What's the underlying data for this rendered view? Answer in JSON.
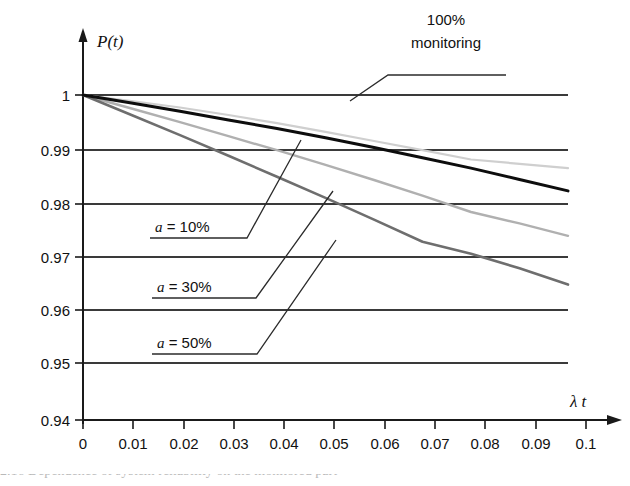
{
  "figure": {
    "caption_fragment": "2.16   Dependence of system reliability on the monitored part"
  },
  "axes": {
    "y_title": "P(t)",
    "x_title": "λ t",
    "y_ticks": [
      "1",
      "0.99",
      "0.98",
      "0.97",
      "0.96",
      "0.95",
      "0.94"
    ],
    "x_ticks": [
      "0",
      "0.01",
      "0.02",
      "0.03",
      "0.04",
      "0.05",
      "0.06",
      "0.07",
      "0.08",
      "0.09",
      "0.1"
    ]
  },
  "annotations": {
    "monitoring": {
      "line1": "100%",
      "line2": "monitoring"
    },
    "a10": {
      "var": "a",
      "rest": " = 10%"
    },
    "a30": {
      "var": "a",
      "rest": " = 30%"
    },
    "a50": {
      "var": "a",
      "rest": " = 50%"
    }
  },
  "colors": {
    "axis": "#1a1a1a",
    "gridline": "#3a3a3a",
    "monitoring": "#cfcfcf",
    "a10": "#0d0d0d",
    "a30": "#b0b0b0",
    "a50": "#6e6e6e",
    "leader": "#2b2b2b"
  },
  "chart_data": {
    "type": "line",
    "title": "",
    "xlabel": "λ t",
    "ylabel": "P(t)",
    "xlim": [
      0,
      0.1
    ],
    "ylim": [
      0.94,
      1.0
    ],
    "grid": true,
    "legend": "inline-callouts",
    "x": [
      0,
      0.01,
      0.02,
      0.03,
      0.04,
      0.05,
      0.06,
      0.07,
      0.08,
      0.09,
      0.1
    ],
    "series": [
      {
        "name": "100% monitoring",
        "color": "#cfcfcf",
        "values": [
          1.0,
          0.9989,
          0.9977,
          0.9963,
          0.9948,
          0.9932,
          0.9915,
          0.9898,
          0.9881,
          0.9873,
          0.9865
        ]
      },
      {
        "name": "a = 10%",
        "color": "#0d0d0d",
        "values": [
          1.0,
          0.9985,
          0.997,
          0.9954,
          0.9938,
          0.9921,
          0.9903,
          0.9884,
          0.9865,
          0.9844,
          0.9823
        ]
      },
      {
        "name": "a = 30%",
        "color": "#b0b0b0",
        "values": [
          1.0,
          0.9975,
          0.995,
          0.9924,
          0.9898,
          0.9871,
          0.9843,
          0.9814,
          0.9784,
          0.9763,
          0.974
        ]
      },
      {
        "name": "a = 50%",
        "color": "#6e6e6e",
        "values": [
          1.0,
          0.9963,
          0.9926,
          0.9888,
          0.9849,
          0.981,
          0.977,
          0.9729,
          0.9707,
          0.968,
          0.965
        ]
      }
    ]
  },
  "geometry": {
    "plot": {
      "x0": 83,
      "x1": 586,
      "grid_right": 568,
      "y_top": 95,
      "y_bottom": 420
    },
    "y_positions": [
      95,
      150,
      204,
      257,
      310,
      363,
      420
    ],
    "x_positions": [
      83,
      133,
      184,
      234,
      284,
      334,
      385,
      435,
      485,
      536,
      586
    ]
  }
}
